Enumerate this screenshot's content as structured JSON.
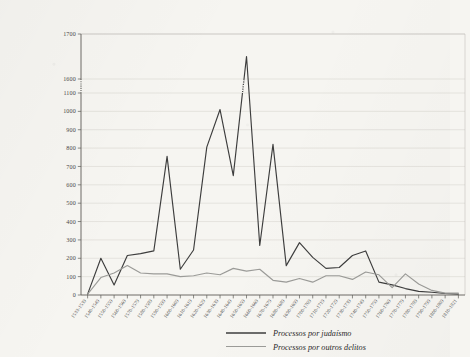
{
  "chart_data": {
    "type": "line",
    "title": "",
    "subtitle": "",
    "xlabel": "",
    "ylabel": "",
    "grid": "horizontal",
    "legend_position": "bottom-center",
    "y_axis_break": {
      "present": true,
      "between": [
        1100,
        1600
      ],
      "style": "dotted"
    },
    "ylim": [
      0,
      1700
    ],
    "yticks": [
      0,
      100,
      200,
      300,
      400,
      500,
      600,
      700,
      800,
      900,
      1000,
      1100,
      1600,
      1700
    ],
    "ytick_labels": [
      "0",
      "100",
      "200",
      "300",
      "400",
      "500",
      "600",
      "700",
      "800",
      "900",
      "1000",
      "1100",
      "1600",
      "1700"
    ],
    "categories": [
      "1533-1539",
      "1540-1549",
      "1550-1559",
      "1560-1569",
      "1570-1579",
      "1580-1589",
      "1590-1599",
      "1600-1609",
      "1610-1619",
      "1620-1629",
      "1630-1639",
      "1640-1649",
      "1650-1659",
      "1660-1669",
      "1670-1679",
      "1680-1689",
      "1690-1699",
      "1700-1709",
      "1710-1719",
      "1720-1729",
      "1730-1739",
      "1740-1749",
      "1750-1759",
      "1760-1769",
      "1770-1779",
      "1780-1789",
      "1790-1799",
      "1800-1809",
      "1810-1821"
    ],
    "series": [
      {
        "name": "Processos por judaísmo",
        "color": "#3d3d3d",
        "values": [
          5,
          200,
          55,
          215,
          225,
          240,
          755,
          140,
          245,
          805,
          1010,
          650,
          1650,
          1230,
          820,
          160,
          285,
          205,
          145,
          150,
          215,
          240,
          70,
          55,
          35,
          20,
          15,
          8,
          5
        ]
      },
      {
        "name": "Processos por outros delitos",
        "color": "#9b9b98",
        "values": [
          5,
          95,
          120,
          160,
          120,
          115,
          115,
          100,
          105,
          120,
          110,
          145,
          130,
          140,
          80,
          70,
          90,
          70,
          105,
          105,
          85,
          125,
          110,
          40,
          115,
          60,
          25,
          10,
          10
        ]
      }
    ],
    "legend": [
      {
        "label": "Processos por judaísmo",
        "color": "#3d3d3d"
      },
      {
        "label": "Processos por outros delitos",
        "color": "#9b9b98"
      }
    ]
  }
}
